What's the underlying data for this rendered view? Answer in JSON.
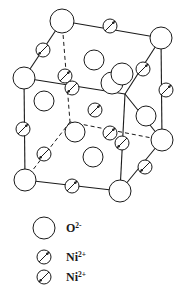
{
  "figure": {
    "background_color": "#ffffff",
    "line_color": "#1a1a1a",
    "circle_fill": "#ffffff"
  },
  "legend": {
    "items": [
      {
        "id": "oxygen",
        "symbol": "large-open-circle",
        "label": "O",
        "charge": "2-",
        "radius": 11,
        "arrow": "none",
        "cx": 44,
        "cy": 228
      },
      {
        "id": "nickel-up",
        "symbol": "small-circle-with-arrow",
        "label": "Ni",
        "charge": "2+",
        "radius": 7,
        "arrow": "up-right",
        "cx": 44,
        "cy": 257
      },
      {
        "id": "nickel-down",
        "symbol": "small-circle-with-arrow",
        "label": "Ni",
        "charge": "2+",
        "radius": 7,
        "arrow": "down-left",
        "cx": 44,
        "cy": 277
      }
    ],
    "label_x": 66
  },
  "structure": {
    "oxygen_radius_corner": 11,
    "oxygen_radius_face": 10,
    "nickel_radius": 6.5,
    "oxygen_atoms": [
      {
        "id": "o-top-front-left",
        "cx": 62,
        "cy": 21,
        "r": 12,
        "role": "corner"
      },
      {
        "id": "o-top-back-right",
        "cx": 161,
        "cy": 38,
        "r": 11,
        "role": "corner"
      },
      {
        "id": "o-mid-left",
        "cx": 24,
        "cy": 78,
        "r": 11,
        "role": "corner"
      },
      {
        "id": "o-bottom-left",
        "cx": 25,
        "cy": 180,
        "r": 11,
        "role": "corner"
      },
      {
        "id": "o-bottom-front-right",
        "cx": 120,
        "cy": 191,
        "r": 11,
        "role": "corner"
      },
      {
        "id": "o-mid-right",
        "cx": 162,
        "cy": 140,
        "r": 11,
        "role": "corner"
      },
      {
        "id": "o-face-top",
        "cx": 94,
        "cy": 60,
        "r": 10,
        "role": "face"
      },
      {
        "id": "o-face-front-upper",
        "cx": 44,
        "cy": 101,
        "r": 10,
        "role": "face"
      },
      {
        "id": "o-face-center-right",
        "cx": 146,
        "cy": 116,
        "r": 10,
        "role": "face"
      },
      {
        "id": "o-face-front-lower",
        "cx": 93,
        "cy": 157,
        "r": 10,
        "role": "face"
      },
      {
        "id": "o-face-inner-left",
        "cx": 75,
        "cy": 132,
        "r": 10,
        "role": "face"
      },
      {
        "id": "o-face-inner-upper",
        "cx": 112,
        "cy": 83,
        "r": 11,
        "role": "face"
      },
      {
        "id": "o-face-inner-top",
        "cx": 122,
        "cy": 74,
        "r": 11,
        "role": "face"
      }
    ],
    "nickel_atoms": [
      {
        "id": "ni-top-edge",
        "cx": 110,
        "cy": 26,
        "r": 7,
        "arrow": "up-right"
      },
      {
        "id": "ni-upper-left-edge",
        "cx": 43,
        "cy": 50,
        "r": 7,
        "arrow": "down-left"
      },
      {
        "id": "ni-back-hidden-upper",
        "cx": 65,
        "cy": 76,
        "r": 7,
        "arrow": "up-right"
      },
      {
        "id": "ni-back-hidden-lower",
        "cx": 72,
        "cy": 88,
        "r": 7,
        "arrow": "down-left"
      },
      {
        "id": "ni-upper-right-edge",
        "cx": 143,
        "cy": 69,
        "r": 7,
        "arrow": "up-right"
      },
      {
        "id": "ni-right-edge-upper",
        "cx": 166,
        "cy": 90,
        "r": 7,
        "arrow": "up-right"
      },
      {
        "id": "ni-body-center",
        "cx": 95,
        "cy": 110,
        "r": 7,
        "arrow": "up-right"
      },
      {
        "id": "ni-left-edge",
        "cx": 23,
        "cy": 129,
        "r": 7,
        "arrow": "up-right"
      },
      {
        "id": "ni-inner-left",
        "cx": 44,
        "cy": 154,
        "r": 7,
        "arrow": "down-left"
      },
      {
        "id": "ni-inner-right-upper",
        "cx": 110,
        "cy": 133,
        "r": 7,
        "arrow": "up-right"
      },
      {
        "id": "ni-inner-right-lower",
        "cx": 122,
        "cy": 143,
        "r": 7,
        "arrow": "down-left"
      },
      {
        "id": "ni-lower-right-edge",
        "cx": 145,
        "cy": 167,
        "r": 7,
        "arrow": "down-left"
      },
      {
        "id": "ni-bottom-edge",
        "cx": 72,
        "cy": 186,
        "r": 7,
        "arrow": "up-right"
      }
    ],
    "solid_edges": [
      {
        "id": "edge-top-front-to-top-back",
        "x1": 62,
        "y1": 21,
        "x2": 161,
        "y2": 38
      },
      {
        "id": "edge-top-front-to-mid-left",
        "x1": 62,
        "y1": 21,
        "x2": 24,
        "y2": 78
      },
      {
        "id": "edge-mid-left-to-inner",
        "x1": 24,
        "y1": 78,
        "x2": 125,
        "y2": 94
      },
      {
        "id": "edge-top-back-to-mid-right",
        "x1": 161,
        "y1": 38,
        "x2": 162,
        "y2": 140
      },
      {
        "id": "edge-inner-to-mid-right",
        "x1": 125,
        "y1": 94,
        "x2": 162,
        "y2": 140
      },
      {
        "id": "edge-inner-vertical",
        "x1": 125,
        "y1": 94,
        "x2": 120,
        "y2": 191
      },
      {
        "id": "edge-mid-left-vertical",
        "x1": 24,
        "y1": 78,
        "x2": 25,
        "y2": 180
      },
      {
        "id": "edge-bottom-left-to-bottom-right",
        "x1": 25,
        "y1": 180,
        "x2": 120,
        "y2": 191
      },
      {
        "id": "edge-bottom-right-to-mid-right",
        "x1": 120,
        "y1": 191,
        "x2": 162,
        "y2": 140
      },
      {
        "id": "edge-top-back-to-inner",
        "x1": 161,
        "y1": 38,
        "x2": 125,
        "y2": 94
      }
    ],
    "dashed_edges": [
      {
        "id": "hidden-vertical-top",
        "x1": 62,
        "y1": 21,
        "x2": 70,
        "y2": 122
      },
      {
        "id": "hidden-back-left",
        "x1": 25,
        "y1": 180,
        "x2": 70,
        "y2": 122
      },
      {
        "id": "hidden-back-right",
        "x1": 70,
        "y1": 122,
        "x2": 162,
        "y2": 140
      }
    ]
  }
}
